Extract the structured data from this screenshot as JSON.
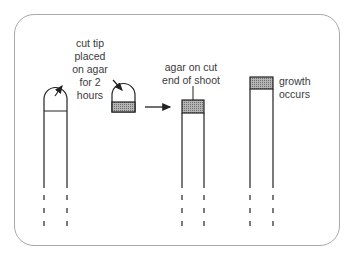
{
  "diagram": {
    "labels": {
      "cut_tip": "cut tip placed on agar for 2 hours",
      "agar_on_cut": "agar on cut end of shoot",
      "growth": "growth occurs"
    },
    "label_lines": {
      "cut_tip": [
        "cut tip",
        "placed",
        "on agar",
        "for 2",
        "hours"
      ],
      "agar_on_cut": [
        "agar on cut",
        "end of shoot"
      ],
      "growth": [
        "growth",
        "occurs"
      ]
    },
    "colors": {
      "stroke": "#222222",
      "frame": "#a9a9a9",
      "agar_fill": "#9a9a9a",
      "text": "#3a3a3a"
    },
    "stages": [
      {
        "name": "intact-shoot-with-tip"
      },
      {
        "name": "cut-tip-on-agar"
      },
      {
        "name": "decapitated-shoot-with-agar"
      },
      {
        "name": "shoot-grows"
      }
    ]
  }
}
